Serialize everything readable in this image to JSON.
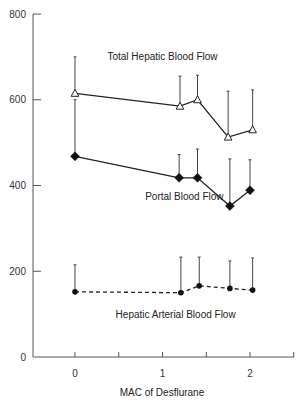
{
  "chart_data": {
    "type": "line",
    "title": "",
    "xlabel": "MAC of Desflurane",
    "ylabel": "",
    "xlim": [
      -0.85,
      2.5
    ],
    "ylim": [
      0,
      800
    ],
    "x_ticks": [
      0,
      0.5,
      1,
      1.5,
      2,
      2.5
    ],
    "x_tick_labels": [
      "0",
      "",
      "1",
      "",
      "2",
      ""
    ],
    "y_ticks": [
      0,
      200,
      400,
      600,
      800
    ],
    "y_tick_labels": [
      "0",
      "200",
      "400",
      "600",
      "800"
    ],
    "grid": false,
    "legend": "inline labels",
    "series": [
      {
        "name": "Total Hepatic Blood Flow",
        "marker": "open-triangle",
        "line": "solid",
        "x": [
          0,
          1.2,
          1.4,
          1.75,
          2.03
        ],
        "values": [
          615,
          585,
          600,
          513,
          530
        ],
        "error_upper": [
          700,
          655,
          657,
          620,
          623
        ],
        "label_pos": {
          "x": 1.0,
          "y": 700
        }
      },
      {
        "name": "Portal Blood Flow",
        "marker": "filled-diamond",
        "line": "solid",
        "x": [
          0,
          1.19,
          1.4,
          1.77,
          2.0
        ],
        "values": [
          468,
          418,
          418,
          352,
          389
        ],
        "error_upper": [
          600,
          472,
          485,
          462,
          460
        ],
        "label_pos": {
          "x": 1.25,
          "y": 375
        }
      },
      {
        "name": "Hepatic Arterial Blood Flow",
        "marker": "filled-circle",
        "line": "dashed",
        "x": [
          0,
          1.21,
          1.42,
          1.77,
          2.03
        ],
        "values": [
          152,
          150,
          166,
          160,
          156
        ],
        "error_upper": [
          215,
          233,
          233,
          224,
          231
        ],
        "label_pos": {
          "x": 1.15,
          "y": 100
        }
      }
    ]
  }
}
